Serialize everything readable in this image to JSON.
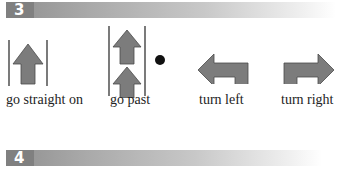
{
  "sections": [
    {
      "number": "3"
    },
    {
      "number": "4"
    }
  ],
  "items": [
    {
      "label": "go straight on",
      "icon": "straight-arrow-icon"
    },
    {
      "label": "go past",
      "icon": "go-past-icon"
    },
    {
      "label": "turn left",
      "icon": "turn-left-icon"
    },
    {
      "label": "turn right",
      "icon": "turn-right-icon"
    }
  ],
  "colors": {
    "arrow_fill": "#7c7c7c",
    "arrow_stroke": "#4a4a4a",
    "bar_dark": "#808080"
  }
}
